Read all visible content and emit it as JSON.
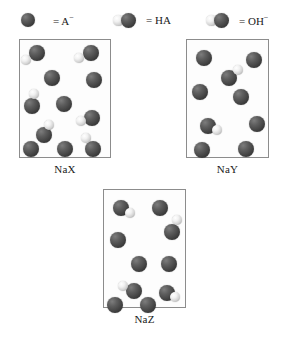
{
  "legend": {
    "items": [
      {
        "id": "anion",
        "equals": "=",
        "label": "A",
        "charge": "−",
        "art": "single-dark-sphere",
        "x": 20,
        "y": 10
      },
      {
        "id": "acid",
        "equals": "=",
        "label": "HA",
        "charge": "",
        "art": "light-left-dark-right-pair",
        "x": 113,
        "y": 10
      },
      {
        "id": "hydroxide",
        "equals": "=",
        "label": "OH",
        "charge": "−",
        "art": "light-left-dark-right-pair",
        "x": 206,
        "y": 10
      }
    ]
  },
  "boxes": [
    {
      "id": "nax",
      "label": "NaX",
      "rect": {
        "x": 19,
        "y": 39,
        "w": 92,
        "h": 119
      },
      "label_rect": {
        "x": 19,
        "y": 163,
        "w": 92
      },
      "particles": [
        {
          "type": "dark",
          "x": 29,
          "y": 45,
          "d": 16
        },
        {
          "type": "light",
          "x": 21,
          "y": 55,
          "d": 10
        },
        {
          "type": "dark",
          "x": 83,
          "y": 45,
          "d": 16
        },
        {
          "type": "light",
          "x": 74,
          "y": 53,
          "d": 10
        },
        {
          "type": "dark",
          "x": 44,
          "y": 70,
          "d": 16
        },
        {
          "type": "dark",
          "x": 86,
          "y": 72,
          "d": 16
        },
        {
          "type": "dark",
          "x": 24,
          "y": 98,
          "d": 16
        },
        {
          "type": "light",
          "x": 29,
          "y": 89,
          "d": 10
        },
        {
          "type": "dark",
          "x": 56,
          "y": 96,
          "d": 16
        },
        {
          "type": "dark",
          "x": 84,
          "y": 110,
          "d": 16
        },
        {
          "type": "light",
          "x": 76,
          "y": 116,
          "d": 10
        },
        {
          "type": "dark",
          "x": 36,
          "y": 127,
          "d": 16
        },
        {
          "type": "light",
          "x": 44,
          "y": 120,
          "d": 10
        },
        {
          "type": "dark",
          "x": 23,
          "y": 141,
          "d": 16
        },
        {
          "type": "dark",
          "x": 57,
          "y": 141,
          "d": 16
        },
        {
          "type": "dark",
          "x": 85,
          "y": 141,
          "d": 16
        },
        {
          "type": "light",
          "x": 81,
          "y": 133,
          "d": 10
        }
      ]
    },
    {
      "id": "nay",
      "label": "NaY",
      "rect": {
        "x": 186,
        "y": 39,
        "w": 83,
        "h": 119
      },
      "label_rect": {
        "x": 186,
        "y": 163,
        "w": 83
      },
      "particles": [
        {
          "type": "dark",
          "x": 196,
          "y": 50,
          "d": 16
        },
        {
          "type": "dark",
          "x": 246,
          "y": 52,
          "d": 16
        },
        {
          "type": "dark",
          "x": 221,
          "y": 70,
          "d": 16
        },
        {
          "type": "light",
          "x": 233,
          "y": 65,
          "d": 10
        },
        {
          "type": "dark",
          "x": 192,
          "y": 84,
          "d": 16
        },
        {
          "type": "dark",
          "x": 233,
          "y": 89,
          "d": 16
        },
        {
          "type": "dark",
          "x": 200,
          "y": 118,
          "d": 16
        },
        {
          "type": "light",
          "x": 212,
          "y": 125,
          "d": 10
        },
        {
          "type": "dark",
          "x": 249,
          "y": 116,
          "d": 16
        },
        {
          "type": "dark",
          "x": 194,
          "y": 142,
          "d": 16
        },
        {
          "type": "dark",
          "x": 238,
          "y": 141,
          "d": 16
        }
      ]
    },
    {
      "id": "naz",
      "label": "NaZ",
      "rect": {
        "x": 103,
        "y": 189,
        "w": 83,
        "h": 119
      },
      "label_rect": {
        "x": 103,
        "y": 313,
        "w": 83
      },
      "particles": [
        {
          "type": "dark",
          "x": 113,
          "y": 200,
          "d": 16
        },
        {
          "type": "light",
          "x": 125,
          "y": 208,
          "d": 10
        },
        {
          "type": "dark",
          "x": 152,
          "y": 200,
          "d": 16
        },
        {
          "type": "dark",
          "x": 110,
          "y": 232,
          "d": 16
        },
        {
          "type": "dark",
          "x": 164,
          "y": 224,
          "d": 16
        },
        {
          "type": "light",
          "x": 172,
          "y": 215,
          "d": 10
        },
        {
          "type": "dark",
          "x": 131,
          "y": 256,
          "d": 16
        },
        {
          "type": "dark",
          "x": 161,
          "y": 256,
          "d": 16
        },
        {
          "type": "dark",
          "x": 126,
          "y": 283,
          "d": 16
        },
        {
          "type": "light",
          "x": 118,
          "y": 281,
          "d": 10
        },
        {
          "type": "dark",
          "x": 159,
          "y": 285,
          "d": 16
        },
        {
          "type": "light",
          "x": 170,
          "y": 292,
          "d": 10
        },
        {
          "type": "dark",
          "x": 107,
          "y": 297,
          "d": 16
        },
        {
          "type": "dark",
          "x": 140,
          "y": 297,
          "d": 16
        }
      ]
    }
  ]
}
